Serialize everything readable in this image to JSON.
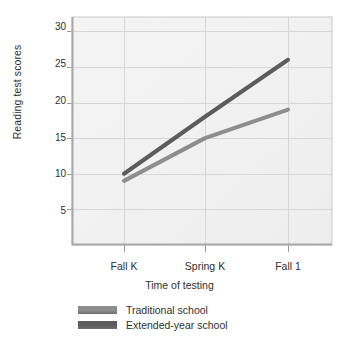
{
  "chart_data": {
    "type": "line",
    "title": "",
    "xlabel": "Time of testing",
    "ylabel": "Reading test scores",
    "categories": [
      "Fall K",
      "Spring K",
      "Fall 1"
    ],
    "yticks": [
      5,
      10,
      15,
      20,
      25,
      30
    ],
    "ylim": [
      0,
      32
    ],
    "grid": true,
    "legend_position": "bottom-left",
    "series": [
      {
        "name": "Traditional school",
        "color": "#8d8d8d",
        "values": [
          9,
          15,
          19
        ]
      },
      {
        "name": "Extended-year school",
        "color": "#5c5c5c",
        "values": [
          10,
          18,
          26
        ]
      }
    ]
  },
  "colors": {
    "plot_background": "#f2f2f2",
    "gridline": "#d6d6d6",
    "axis": "#9a9a9a",
    "text": "#2f2f2f",
    "traditional": "#8d8d8d",
    "extended": "#5c5c5c"
  },
  "ytick_labels": [
    "30",
    "25",
    "20",
    "15",
    "10",
    "5"
  ],
  "xtick_labels": [
    "Fall K",
    "Spring K",
    "Fall 1"
  ],
  "axis_titles": {
    "y": "Reading test scores",
    "x": "Time of testing"
  },
  "legend": {
    "items": [
      {
        "label": "Traditional school"
      },
      {
        "label": "Extended-year school"
      }
    ]
  }
}
